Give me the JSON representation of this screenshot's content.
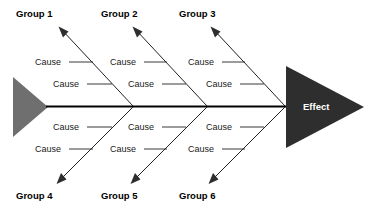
{
  "diagram": {
    "type": "fishbone-ishikawa",
    "background_color": "#ffffff",
    "effect": {
      "label": "Effect",
      "shape": "triangle-right",
      "fill_color": "#2e2e2e",
      "text_color": "#ffffff"
    },
    "tail": {
      "shape": "triangle-right",
      "fill_color": "#6f6f6f"
    },
    "spine": {
      "color": "#000000",
      "orientation": "horizontal"
    },
    "groups": [
      {
        "id": "group-1",
        "label": "Group 1",
        "position": "top",
        "column": 1,
        "causes": [
          {
            "label": "Cause"
          },
          {
            "label": "Cause"
          }
        ]
      },
      {
        "id": "group-2",
        "label": "Group 2",
        "position": "top",
        "column": 2,
        "causes": [
          {
            "label": "Cause"
          },
          {
            "label": "Cause"
          }
        ]
      },
      {
        "id": "group-3",
        "label": "Group 3",
        "position": "top",
        "column": 3,
        "causes": [
          {
            "label": "Cause"
          },
          {
            "label": "Cause"
          }
        ]
      },
      {
        "id": "group-4",
        "label": "Group 4",
        "position": "bottom",
        "column": 1,
        "causes": [
          {
            "label": "Cause"
          },
          {
            "label": "Cause"
          }
        ]
      },
      {
        "id": "group-5",
        "label": "Group 5",
        "position": "bottom",
        "column": 2,
        "causes": [
          {
            "label": "Cause"
          },
          {
            "label": "Cause"
          }
        ]
      },
      {
        "id": "group-6",
        "label": "Group 6",
        "position": "bottom",
        "column": 3,
        "causes": [
          {
            "label": "Cause"
          },
          {
            "label": "Cause"
          }
        ]
      }
    ]
  }
}
